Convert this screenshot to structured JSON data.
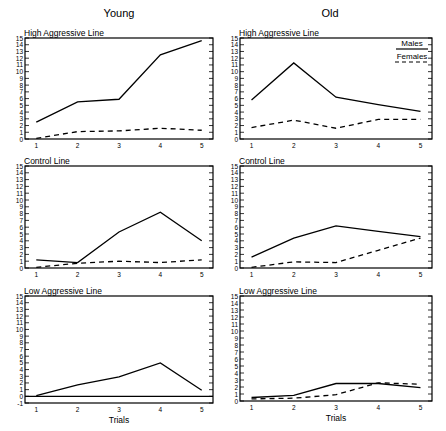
{
  "columns": {
    "young": "Young",
    "old": "Old"
  },
  "legend": {
    "males": "Males",
    "females": "Females"
  },
  "colors": {
    "line": "#000000",
    "background": "#ffffff"
  },
  "chart_data": [
    {
      "type": "line",
      "panel": "young-high",
      "title": "High Aggressive Line",
      "column": "Young",
      "x": [
        1,
        2,
        3,
        4,
        5
      ],
      "xlabel": "",
      "ylabel": "",
      "ylim": [
        0,
        15
      ],
      "series": [
        {
          "name": "Males",
          "style": "solid",
          "values": [
            2.5,
            5.5,
            5.9,
            12.5,
            14.6
          ]
        },
        {
          "name": "Females",
          "style": "dashed",
          "values": [
            0.1,
            1.1,
            1.2,
            1.6,
            1.3
          ]
        }
      ]
    },
    {
      "type": "line",
      "panel": "old-high",
      "title": "High Aggressive Line",
      "column": "Old",
      "x": [
        1,
        2,
        3,
        4,
        5
      ],
      "xlabel": "",
      "ylabel": "",
      "ylim": [
        0,
        15
      ],
      "legend_position": "upper right",
      "series": [
        {
          "name": "Males",
          "style": "solid",
          "values": [
            5.8,
            11.3,
            6.2,
            5.1,
            4.1
          ]
        },
        {
          "name": "Females",
          "style": "dashed",
          "values": [
            1.7,
            2.8,
            1.6,
            2.9,
            2.9
          ]
        }
      ]
    },
    {
      "type": "line",
      "panel": "young-control",
      "title": "Control Line",
      "column": "Young",
      "x": [
        1,
        2,
        3,
        4,
        5
      ],
      "xlabel": "",
      "ylabel": "",
      "ylim": [
        0,
        15
      ],
      "series": [
        {
          "name": "Males",
          "style": "solid",
          "values": [
            1.2,
            0.8,
            5.3,
            8.2,
            4.0
          ]
        },
        {
          "name": "Females",
          "style": "dashed",
          "values": [
            0.1,
            0.7,
            1.0,
            0.8,
            1.2
          ]
        }
      ]
    },
    {
      "type": "line",
      "panel": "old-control",
      "title": "Control Line",
      "column": "Old",
      "x": [
        1,
        2,
        3,
        4,
        5
      ],
      "xlabel": "",
      "ylabel": "",
      "ylim": [
        0,
        15
      ],
      "series": [
        {
          "name": "Males",
          "style": "solid",
          "values": [
            1.6,
            4.4,
            6.2,
            5.4,
            4.6
          ]
        },
        {
          "name": "Females",
          "style": "dashed",
          "values": [
            0.1,
            0.9,
            0.8,
            2.6,
            4.4
          ]
        }
      ]
    },
    {
      "type": "line",
      "panel": "young-low",
      "title": "Low Aggressive Line",
      "column": "Young",
      "x": [
        1,
        2,
        3,
        4,
        5
      ],
      "xlabel": "Trials",
      "ylabel": "",
      "ylim": [
        -1,
        15
      ],
      "series": [
        {
          "name": "Males",
          "style": "solid",
          "values": [
            0.1,
            1.7,
            2.9,
            5.0,
            0.9
          ]
        },
        {
          "name": "Females",
          "style": "solid-zero",
          "values": [
            0,
            0,
            0,
            0,
            0
          ]
        }
      ]
    },
    {
      "type": "line",
      "panel": "old-low",
      "title": "Low Aggressive Line",
      "column": "Old",
      "x": [
        1,
        2,
        3,
        4,
        5
      ],
      "xlabel": "Trials",
      "ylabel": "",
      "ylim": [
        0,
        15
      ],
      "series": [
        {
          "name": "Males",
          "style": "solid",
          "values": [
            0.5,
            0.8,
            2.5,
            2.5,
            1.9
          ]
        },
        {
          "name": "Females",
          "style": "dashed",
          "values": [
            0.3,
            0.4,
            0.9,
            2.6,
            2.4
          ]
        }
      ]
    }
  ],
  "layout": [
    {
      "left": 25,
      "right": 213,
      "top": 38,
      "bottom": 139
    },
    {
      "left": 240,
      "right": 432,
      "top": 38,
      "bottom": 139
    },
    {
      "left": 25,
      "right": 213,
      "top": 166,
      "bottom": 268
    },
    {
      "left": 240,
      "right": 432,
      "top": 166,
      "bottom": 268
    },
    {
      "left": 25,
      "right": 213,
      "top": 296,
      "bottom": 403
    },
    {
      "left": 240,
      "right": 432,
      "top": 296,
      "bottom": 401
    }
  ]
}
